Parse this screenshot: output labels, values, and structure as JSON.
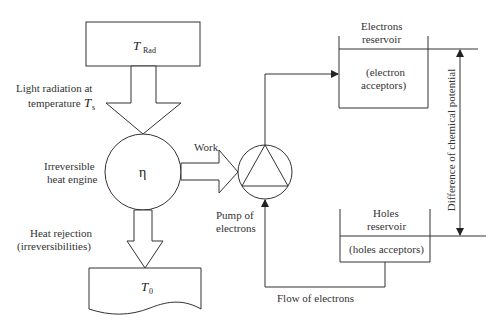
{
  "diagram": {
    "nodes": {
      "source": {
        "symbol": "T",
        "subscript": "Rad"
      },
      "engine": {
        "symbol": "η",
        "label_line1": "Irreversible",
        "label_line2": "heat engine"
      },
      "sink": {
        "symbol": "T",
        "subscript": "0"
      },
      "pump": {
        "label_line1": "Pump of",
        "label_line2": "electrons"
      },
      "electrons_reservoir": {
        "title_line1": "Electrons",
        "title_line2": "reservoir",
        "content_line1": "(electron",
        "content_line2": "acceptors)"
      },
      "holes_reservoir": {
        "title_line1": "Holes",
        "title_line2": "reservoir",
        "content": "(holes acceptors)"
      }
    },
    "labels": {
      "light_line1": "Light radiation at",
      "light_line2": "temperature",
      "light_symbol": "T",
      "light_subscript": "s",
      "work": "Work",
      "heat_line1": "Heat rejection",
      "heat_line2": "(irreversibilities)",
      "flow": "Flow of electrons",
      "potential": "Difference of chemical potential"
    }
  }
}
